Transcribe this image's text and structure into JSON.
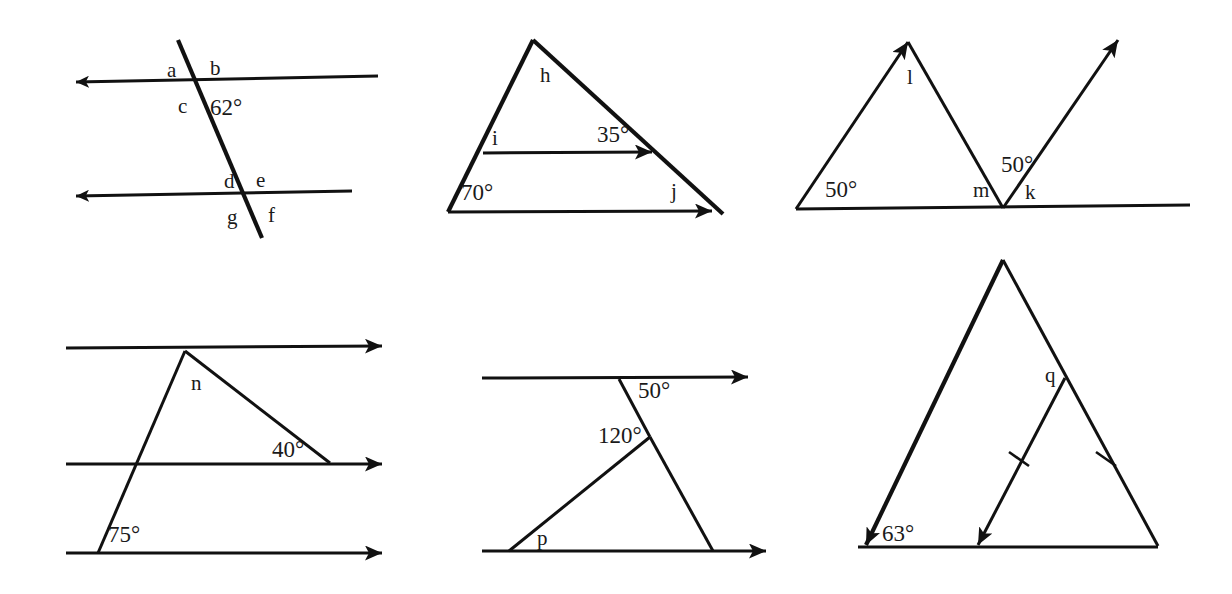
{
  "page": {
    "kind": "geometry-worksheet-diagram",
    "background_color": "#ffffff",
    "ink_color": "#111111",
    "width": 1232,
    "height": 594,
    "figure_count": 6
  },
  "figures": [
    {
      "id": "fig1",
      "name": "two-parallel-lines-with-transversal",
      "description": "Two leftward-arrowed parallel lines cut by a transversal; eight labelled angles",
      "labels": [
        {
          "key": "a",
          "text": "a",
          "x": 167,
          "y": 77,
          "type": "letter"
        },
        {
          "key": "b",
          "text": "b",
          "x": 210,
          "y": 75,
          "type": "letter"
        },
        {
          "key": "c",
          "text": "c",
          "x": 178,
          "y": 113,
          "type": "letter"
        },
        {
          "key": "d",
          "text": "d",
          "x": 224,
          "y": 188,
          "type": "letter"
        },
        {
          "key": "e",
          "text": "e",
          "x": 256,
          "y": 187,
          "type": "letter"
        },
        {
          "key": "f",
          "text": "f",
          "x": 268,
          "y": 222,
          "type": "letter"
        },
        {
          "key": "g",
          "text": "g",
          "x": 227,
          "y": 224,
          "type": "letter"
        },
        {
          "key": "angle62",
          "text": "62°",
          "x": 210,
          "y": 115,
          "type": "angle"
        }
      ],
      "angle_values": [
        {
          "label": "62°",
          "degrees": 62
        }
      ]
    },
    {
      "id": "fig2",
      "name": "triangle-with-parallel-cevian",
      "description": "Triangle with 70° base angle, an inner arrowed segment parallel to the arrowed base; angles h, i, j and 35°",
      "labels": [
        {
          "key": "h",
          "text": "h",
          "x": 540,
          "y": 82,
          "type": "letter"
        },
        {
          "key": "i",
          "text": "i",
          "x": 492,
          "y": 145,
          "type": "letter"
        },
        {
          "key": "angle35",
          "text": "35°",
          "x": 597,
          "y": 142,
          "type": "angle"
        },
        {
          "key": "j",
          "text": "j",
          "x": 671,
          "y": 198,
          "type": "letter"
        },
        {
          "key": "angle70",
          "text": "70°",
          "x": 461,
          "y": 200,
          "type": "angle"
        }
      ],
      "angle_values": [
        {
          "label": "70°",
          "degrees": 70
        },
        {
          "label": "35°",
          "degrees": 35
        }
      ]
    },
    {
      "id": "fig3",
      "name": "zigzag-rays-on-baseline",
      "description": "Baseline with two upward rays forming a zigzag; two 50° angles and labels l, m, k",
      "labels": [
        {
          "key": "l",
          "text": "l",
          "x": 907,
          "y": 84,
          "type": "letter"
        },
        {
          "key": "angle50left",
          "text": "50°",
          "x": 825,
          "y": 197,
          "type": "angle"
        },
        {
          "key": "m",
          "text": "m",
          "x": 973,
          "y": 197,
          "type": "letter"
        },
        {
          "key": "angle50right",
          "text": "50°",
          "x": 1001,
          "y": 172,
          "type": "angle"
        },
        {
          "key": "k",
          "text": "k",
          "x": 1025,
          "y": 199,
          "type": "letter"
        }
      ],
      "angle_values": [
        {
          "label": "50°",
          "degrees": 50
        },
        {
          "label": "50°",
          "degrees": 50
        }
      ]
    },
    {
      "id": "fig4",
      "name": "three-parallel-lines-with-transversals",
      "description": "Three rightward-arrowed parallel lines crossed by two transversals; 75°, 40° and angle n",
      "labels": [
        {
          "key": "n",
          "text": "n",
          "x": 191,
          "y": 390,
          "type": "letter"
        },
        {
          "key": "angle40",
          "text": "40°",
          "x": 272,
          "y": 457,
          "type": "angle"
        },
        {
          "key": "angle75",
          "text": "75°",
          "x": 108,
          "y": 542,
          "type": "angle"
        }
      ],
      "angle_values": [
        {
          "label": "75°",
          "degrees": 75
        },
        {
          "label": "40°",
          "degrees": 40
        }
      ]
    },
    {
      "id": "fig5",
      "name": "parallel-lines-with-bent-transversal",
      "description": "Two rightward-arrowed parallel lines with a bent transversal; 50°, 120° and angle p",
      "labels": [
        {
          "key": "angle50",
          "text": "50°",
          "x": 638,
          "y": 398,
          "type": "angle"
        },
        {
          "key": "angle120",
          "text": "120°",
          "x": 598,
          "y": 443,
          "type": "angle"
        },
        {
          "key": "p",
          "text": "p",
          "x": 537,
          "y": 545,
          "type": "letter"
        }
      ],
      "angle_values": [
        {
          "label": "50°",
          "degrees": 50
        },
        {
          "label": "120°",
          "degrees": 120
        }
      ]
    },
    {
      "id": "fig6",
      "name": "triangle-with-parallel-segment-and-tick-marks",
      "description": "Large triangle whose left side is arrowed; an inner arrowed segment parallel to it, with single tick marks on the inner segment and the right side; 63° and angle q",
      "labels": [
        {
          "key": "q",
          "text": "q",
          "x": 1045,
          "y": 382,
          "type": "letter"
        },
        {
          "key": "angle63",
          "text": "63°",
          "x": 882,
          "y": 541,
          "type": "angle"
        }
      ],
      "angle_values": [
        {
          "label": "63°",
          "degrees": 63
        }
      ],
      "tick_marks": 2
    }
  ]
}
